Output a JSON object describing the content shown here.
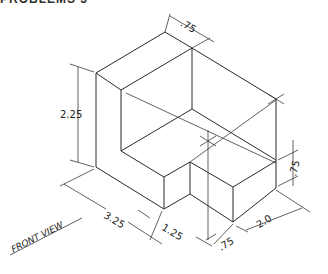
{
  "heading": "PROBLEMS 5",
  "view_label": "FRONT VIEW",
  "dimensions": {
    "height_total": "2.25",
    "top_thickness": ".75",
    "right_step_height": ".75",
    "length_total": "3.25",
    "notch_width": "1.25",
    "right_step_width": ".75",
    "depth": "2.0"
  },
  "colors": {
    "line": "#2a2a2a",
    "background": "#ffffff"
  }
}
